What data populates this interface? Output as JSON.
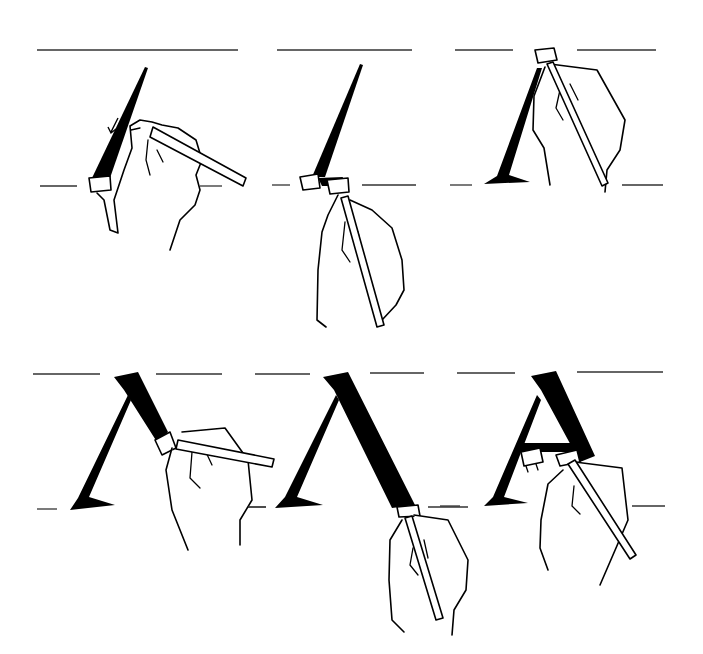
{
  "figure": {
    "layout": {
      "rows": 2,
      "columns": 3
    },
    "colors": {
      "ink": "#000000",
      "paper": "#ffffff",
      "guide_lines": "#333333"
    },
    "panels": [
      {
        "id": 1,
        "row": 1,
        "step": "first thin diagonal stroke down-left, arrow indicates direction"
      },
      {
        "id": 2,
        "row": 1,
        "step": "stroke completed, pen lifted at baseline"
      },
      {
        "id": 3,
        "row": 1,
        "step": "pen at top, left stroke with foot serif finished"
      },
      {
        "id": 4,
        "row": 2,
        "step": "thick right stroke begun from apex"
      },
      {
        "id": 5,
        "row": 2,
        "step": "thick right stroke brought down to baseline"
      },
      {
        "id": 6,
        "row": 2,
        "step": "crossbar drawn to complete the A"
      }
    ]
  }
}
